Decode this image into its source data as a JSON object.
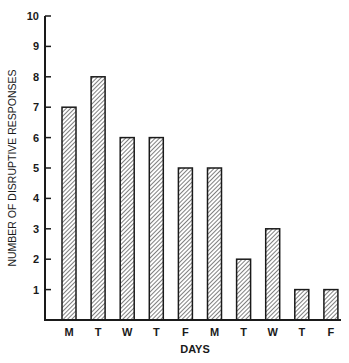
{
  "chart_data": {
    "type": "bar",
    "title": "",
    "xlabel": "DAYS",
    "ylabel": "NUMBER OF DISRUPTIVE RESPONSES",
    "categories": [
      "M",
      "T",
      "W",
      "T",
      "F",
      "M",
      "T",
      "W",
      "T",
      "F"
    ],
    "values": [
      7,
      8,
      6,
      6,
      5,
      5,
      2,
      3,
      1,
      1
    ],
    "ylim": [
      0,
      10
    ],
    "yticks": [
      1,
      2,
      3,
      4,
      5,
      6,
      7,
      8,
      9,
      10
    ],
    "grid": false,
    "legend": null,
    "bar_style": "diagonal-hatch",
    "colors": {
      "ink": "#1a1a1a",
      "hatch": "#3a3a3a",
      "background": "#ffffff"
    }
  }
}
